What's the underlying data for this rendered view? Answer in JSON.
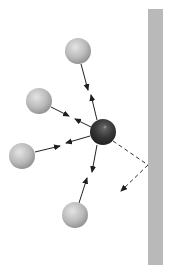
{
  "diagram": {
    "wall": {
      "x": 148,
      "y": 9,
      "width": 15,
      "height": 256,
      "color": "#b9b9b9"
    },
    "central_particle": {
      "cx": 103,
      "cy": 132,
      "r": 13,
      "color": "#3a3a3a"
    },
    "outer_particles": [
      {
        "id": "top",
        "cx": 78,
        "cy": 51,
        "r": 13
      },
      {
        "id": "upper-left",
        "cx": 39,
        "cy": 101,
        "r": 13
      },
      {
        "id": "left",
        "cx": 22,
        "cy": 156,
        "r": 13
      },
      {
        "id": "bottom",
        "cx": 75,
        "cy": 215,
        "r": 13
      }
    ],
    "particle_color": "#b8b8b8",
    "arrow_color": "#222222",
    "dashed_path": {
      "from": [
        113,
        141
      ],
      "bounce": [
        148,
        165
      ],
      "to": [
        118,
        194
      ]
    }
  }
}
